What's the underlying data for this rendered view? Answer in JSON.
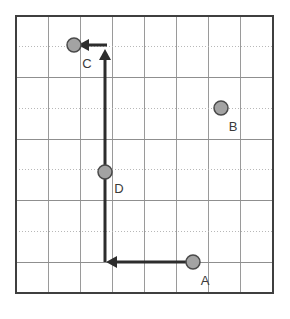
{
  "figure": {
    "kind": "vector-grid-diagram",
    "background_color": "#ffffff",
    "grid": {
      "x_left": 16,
      "y_top": 16,
      "x_right": 273,
      "y_bottom": 293,
      "columns": 8,
      "rows": 9,
      "cell_width": 32.1,
      "cell_height": 30.8,
      "border_color": "#3f3f3f",
      "border_width": 1.6,
      "vertical_line_color": "#9a9a9a",
      "vertical_line_width": 1,
      "vertical_line_style": "solid",
      "horizontal_solid_color": "#8f8f8f",
      "horizontal_dotted_color": "#b8b8b8",
      "horizontal_line_width": 1,
      "horizontal_alternating": "solid,dotted"
    },
    "marker_style": {
      "shape": "circle",
      "radius": 7,
      "fill_color": "#a3a3a3",
      "stroke_color": "#4a4a4a",
      "stroke_width": 1.5
    },
    "vector_style": {
      "stroke_color": "#2d2d2d",
      "stroke_width": 3,
      "arrowhead": "solid-triangle",
      "arrowhead_length": 11,
      "arrowhead_half_width": 6
    },
    "points": [
      {
        "id": "A",
        "label": "A",
        "x": 193,
        "y": 262,
        "label_x": 205,
        "label_y": 285
      },
      {
        "id": "B",
        "label": "B",
        "x": 221,
        "y": 108,
        "label_x": 233,
        "label_y": 131
      },
      {
        "id": "C",
        "label": "C",
        "x": 74,
        "y": 45,
        "label_x": 87,
        "label_y": 68
      },
      {
        "id": "D",
        "label": "D",
        "x": 105,
        "y": 172,
        "label_x": 119,
        "label_y": 193
      }
    ],
    "vectors": [
      {
        "id": "A-to-corner",
        "description": "horizontal leftward from A",
        "from_x": 193,
        "from_y": 262,
        "to_x": 106,
        "to_y": 262,
        "direction": "left",
        "arrowhead": true
      },
      {
        "id": "corner-to-top",
        "description": "vertical upward from bottom corner",
        "from_x": 105,
        "from_y": 262,
        "to_x": 105,
        "to_y": 49,
        "direction": "up",
        "arrowhead": true
      },
      {
        "id": "top-to-C",
        "description": "horizontal leftward into C",
        "from_x": 107,
        "from_y": 45,
        "to_x": 78,
        "to_y": 45,
        "direction": "left",
        "arrowhead": true
      }
    ]
  }
}
